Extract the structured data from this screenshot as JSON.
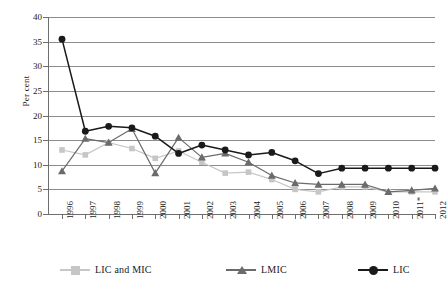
{
  "chart_data": {
    "type": "line",
    "title": "",
    "xlabel": "",
    "ylabel": "Per cent",
    "ylim": [
      0,
      40
    ],
    "yticks": [
      0,
      5,
      10,
      15,
      20,
      25,
      30,
      35,
      40
    ],
    "grid": true,
    "legend_position": "bottom",
    "categories": [
      "1996",
      "1997",
      "1998",
      "1999",
      "2000",
      "2001",
      "2002",
      "2003",
      "2004",
      "2005",
      "2006",
      "2007",
      "2008",
      "2009",
      "2010",
      "2011*",
      "2012"
    ],
    "series": [
      {
        "name": "LIC and MIC",
        "marker": "square",
        "color": "#c6c6c6",
        "values": [
          13.0,
          12.0,
          14.5,
          13.3,
          11.3,
          12.8,
          10.5,
          8.3,
          8.5,
          7.0,
          5.0,
          4.5,
          5.5,
          5.5,
          4.5,
          4.5,
          4.5
        ]
      },
      {
        "name": "LMIC",
        "marker": "triangle",
        "color": "#6b6b6b",
        "values": [
          8.7,
          15.3,
          14.5,
          17.3,
          8.3,
          15.5,
          11.5,
          12.3,
          10.5,
          7.8,
          6.3,
          6.0,
          6.0,
          6.0,
          4.5,
          4.8,
          5.2
        ]
      },
      {
        "name": "LIC",
        "marker": "circle",
        "color": "#1a1a1a",
        "values": [
          35.5,
          16.8,
          17.8,
          17.5,
          15.8,
          12.3,
          14.0,
          13.0,
          12.0,
          12.5,
          10.8,
          8.2,
          9.3,
          9.3,
          9.3,
          9.3,
          9.3
        ]
      }
    ]
  },
  "axis": {
    "y_title": "Per cent"
  },
  "legend": {
    "items": [
      {
        "label": "LIC and MIC"
      },
      {
        "label": "LMIC"
      },
      {
        "label": "LIC"
      }
    ]
  }
}
